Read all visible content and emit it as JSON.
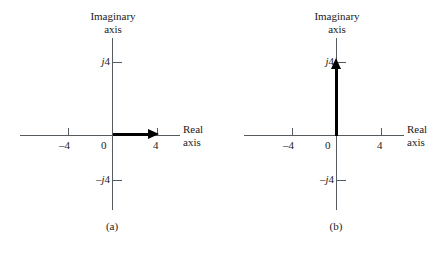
{
  "figure": {
    "background_color": "#ffffff",
    "axis_color": "#555a5e",
    "vector_color": "#000000",
    "width": 448,
    "height": 256
  },
  "chart_data": {
    "type": "scatter",
    "title": "",
    "subtitle": "",
    "panels": [
      {
        "caption": "(a)",
        "xlabel_line1": "Real",
        "xlabel_line2": "axis",
        "ylabel_line1": "Imaginary",
        "ylabel_line2": "axis",
        "origin_label": "0",
        "xlim": [
          -6,
          6
        ],
        "ylim": [
          -6,
          6
        ],
        "grid": false,
        "legend": "none",
        "xticks": [
          -4,
          4
        ],
        "xticklabels": [
          "–4",
          "4"
        ],
        "yticks": [
          4,
          -4
        ],
        "yticklabels": [
          "j4",
          "–j4"
        ],
        "vectors": [
          {
            "name": "phasor-real-4",
            "from": [
              0,
              0
            ],
            "to": [
              4,
              0
            ],
            "orientation": "horizontal",
            "value": "4"
          }
        ]
      },
      {
        "caption": "(b)",
        "xlabel_line1": "Real",
        "xlabel_line2": "axis",
        "ylabel_line1": "Imaginary",
        "ylabel_line2": "axis",
        "origin_label": "0",
        "xlim": [
          -6,
          6
        ],
        "ylim": [
          -6,
          6
        ],
        "grid": false,
        "legend": "none",
        "xticks": [
          -4,
          4
        ],
        "xticklabels": [
          "–4",
          "4"
        ],
        "yticks": [
          4,
          -4
        ],
        "yticklabels": [
          "j4",
          "–j4"
        ],
        "vectors": [
          {
            "name": "phasor-imaginary-j4",
            "from": [
              0,
              0
            ],
            "to": [
              0,
              4
            ],
            "orientation": "vertical",
            "value": "j4"
          }
        ]
      }
    ]
  },
  "panel_a": {
    "caption": "(a)",
    "imag_axis_line1": "Imaginary",
    "imag_axis_line2": "axis",
    "real_axis_line1": "Real",
    "real_axis_line2": "axis",
    "tick_neg4": "–4",
    "tick_pos4": "4",
    "tick_zero": "0",
    "tick_j4_prefix": "j",
    "tick_j4_value": "4",
    "tick_negj4_prefix": "–j",
    "tick_negj4_value": "4"
  },
  "panel_b": {
    "caption": "(b)",
    "imag_axis_line1": "Imaginary",
    "imag_axis_line2": "axis",
    "real_axis_line1": "Real",
    "real_axis_line2": "axis",
    "tick_neg4": "–4",
    "tick_pos4": "4",
    "tick_zero": "0",
    "tick_j4_prefix": "j",
    "tick_j4_value": "4",
    "tick_negj4_prefix": "–j",
    "tick_negj4_value": "4"
  }
}
